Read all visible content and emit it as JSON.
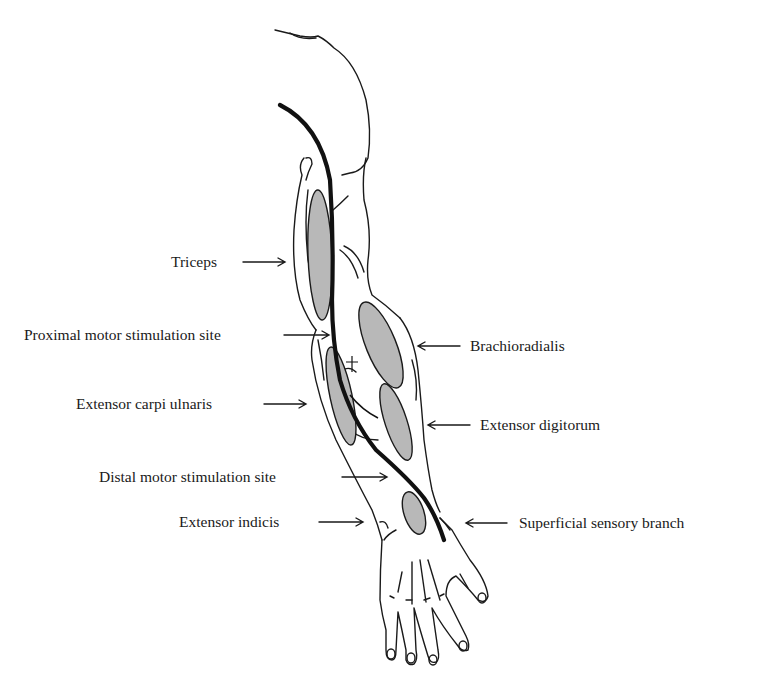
{
  "diagram": {
    "colors": {
      "outline": "#1a1a1a",
      "muscle_fill": "#b8b8b8",
      "nerve": "#111111",
      "background": "#ffffff"
    },
    "labels": [
      {
        "id": "triceps",
        "text": "Triceps",
        "side": "left"
      },
      {
        "id": "proximal-motor-stimulation-site",
        "text": "Proximal motor stimulation site",
        "side": "left"
      },
      {
        "id": "extensor-carpi-ulnaris",
        "text": "Extensor carpi ulnaris",
        "side": "left"
      },
      {
        "id": "distal-motor-stimulation-site",
        "text": "Distal motor stimulation site",
        "side": "left"
      },
      {
        "id": "extensor-indicis",
        "text": "Extensor indicis",
        "side": "left"
      },
      {
        "id": "brachioradialis",
        "text": "Brachioradialis",
        "side": "right"
      },
      {
        "id": "extensor-digitorum",
        "text": "Extensor digitorum",
        "side": "right"
      },
      {
        "id": "superficial-sensory-branch",
        "text": "Superficial sensory branch",
        "side": "right"
      }
    ]
  }
}
